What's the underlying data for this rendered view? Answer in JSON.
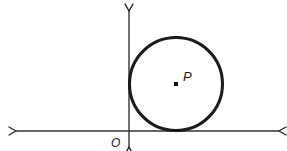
{
  "diagram": {
    "type": "geometry",
    "colors": {
      "stroke": "#1a1a1a",
      "axis": "#333333",
      "background": "#ffffff"
    },
    "axes": {
      "origin_label": "O",
      "x_axis": {
        "arrows": "both"
      },
      "y_axis": {
        "arrows": "both"
      }
    },
    "circle": {
      "center_label": "P",
      "tangent_to": [
        "x-axis",
        "y-axis"
      ]
    }
  }
}
